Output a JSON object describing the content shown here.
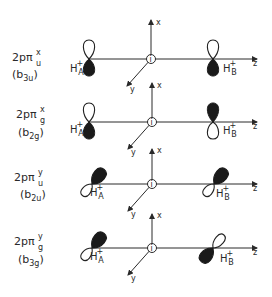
{
  "figure": {
    "type": "molecular-orbital-diagram",
    "colors": {
      "ink": "#2a2a2a",
      "filled_lobe": "#1a1a1a",
      "background": "#ffffff"
    },
    "axis_labels": {
      "x": "x",
      "y": "y",
      "z": "z"
    },
    "center_symbol": "i",
    "rows": [
      {
        "label_main": "2pπ",
        "label_sub": "u",
        "label_sup": "x",
        "symmetry": "(b",
        "symmetry_sub": "3u",
        "symmetry_close": ")",
        "atom_a": {
          "label": "H",
          "sup": "+",
          "sub": "A"
        },
        "atom_b": {
          "label": "H",
          "sup": "+",
          "sub": "B"
        },
        "orientation": "vertical",
        "atom_a_filled": "down",
        "atom_b_filled": "down"
      },
      {
        "label_main": "2pπ",
        "label_sub": "g",
        "label_sup": "x",
        "symmetry": "(b",
        "symmetry_sub": "2g",
        "symmetry_close": ")",
        "atom_a": {
          "label": "H",
          "sup": "+",
          "sub": "A"
        },
        "atom_b": {
          "label": "H",
          "sup": "+",
          "sub": "B"
        },
        "orientation": "vertical",
        "atom_a_filled": "down",
        "atom_b_filled": "up"
      },
      {
        "label_main": "2pπ",
        "label_sub": "u",
        "label_sup": "y",
        "symmetry": "(b",
        "symmetry_sub": "2u",
        "symmetry_close": ")",
        "atom_a": {
          "label": "H",
          "sup": "+",
          "sub": "A"
        },
        "atom_b": {
          "label": "H",
          "sup": "+",
          "sub": "B"
        },
        "orientation": "diagonal",
        "atom_a_filled": "upper-right",
        "atom_b_filled": "upper-right"
      },
      {
        "label_main": "2pπ",
        "label_sub": "g",
        "label_sup": "y",
        "symmetry": "(b",
        "symmetry_sub": "3g",
        "symmetry_close": ")",
        "atom_a": {
          "label": "H",
          "sup": "+",
          "sub": "A"
        },
        "atom_b": {
          "label": "H",
          "sup": "+",
          "sub": "B"
        },
        "orientation": "diagonal",
        "atom_a_filled": "upper-right",
        "atom_b_filled": "lower-left"
      }
    ]
  }
}
